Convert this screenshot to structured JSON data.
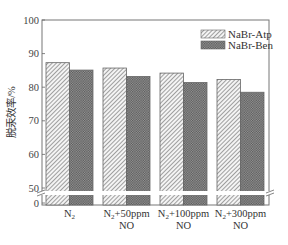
{
  "chart_data": {
    "type": "bar",
    "title": "",
    "xlabel": "",
    "ylabel": "脱汞效率/%",
    "categories": [
      "N₂",
      "N₂+50ppm NO",
      "N₂+100ppm NO",
      "N₂+300ppm NO"
    ],
    "category_lines": [
      [
        "N₂",
        ""
      ],
      [
        "N₂+50ppm",
        "NO"
      ],
      [
        "N₂+100ppm",
        "NO"
      ],
      [
        "N₂+300ppm",
        "NO"
      ]
    ],
    "series": [
      {
        "name": "NaBr-Atp",
        "pattern": "diagonal-hatch",
        "values": [
          87.3,
          85.7,
          84.2,
          82.3
        ]
      },
      {
        "name": "NaBr-Ben",
        "pattern": "crosshatch-dots",
        "values": [
          85.1,
          83.2,
          81.4,
          78.5
        ]
      }
    ],
    "ylim": [
      0,
      100
    ],
    "y_axis_break": [
      0,
      50
    ],
    "yticks": [
      0,
      50,
      60,
      70,
      80,
      90,
      100
    ],
    "grid": false,
    "legend_position": "top-right"
  },
  "colors": {
    "frame": "#666666",
    "atp_hatch": "#555555",
    "ben_fill": "#777777"
  }
}
